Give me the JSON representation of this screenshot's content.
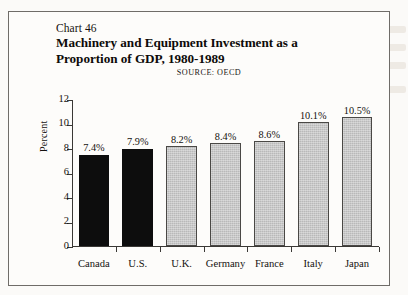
{
  "header": {
    "chart_number": "Chart 46",
    "title_line1": "Machinery and Equipment Investment as a",
    "title_line2": "Proportion of GDP, 1980-1989",
    "source": "SOURCE:  OECD"
  },
  "colors": {
    "page_background": "#fbfaf8",
    "frame_background": "#fdfcfa",
    "frame_border": "#6f6c68",
    "bar_dark": "#0d0d0d",
    "bar_light": "#b9b9b9",
    "bar_light_border": "#4a4845",
    "axis": "#3a3835",
    "text": "#15120f"
  },
  "chart_data": {
    "type": "bar",
    "title": "Machinery and Equipment Investment as a Proportion of GDP, 1980-1989",
    "subtitle": "Chart 46",
    "source": "SOURCE:  OECD",
    "xlabel": "",
    "ylabel": "Percent",
    "ylim": [
      0,
      12
    ],
    "yticks": [
      0,
      2,
      4,
      6,
      8,
      10,
      12
    ],
    "ytick_labels": [
      "0",
      "2",
      "4",
      "6",
      "8",
      "10",
      "12"
    ],
    "grid": false,
    "legend": false,
    "categories": [
      "Canada",
      "U.S.",
      "U.K.",
      "Germany",
      "France",
      "Italy",
      "Japan"
    ],
    "values": [
      7.4,
      7.9,
      8.2,
      8.4,
      8.6,
      10.1,
      10.5
    ],
    "value_labels": [
      "7.4%",
      "7.9%",
      "8.2%",
      "8.4%",
      "8.6%",
      "10.1%",
      "10.5%"
    ],
    "bar_styles": [
      "dark",
      "dark",
      "light",
      "light",
      "light",
      "light",
      "light"
    ]
  }
}
